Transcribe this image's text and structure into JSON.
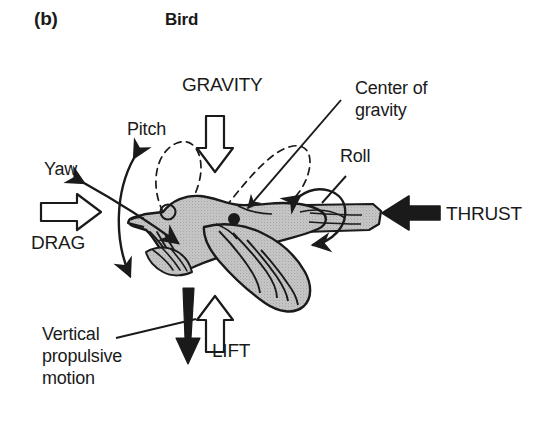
{
  "figure": {
    "panel_letter": "(b)",
    "title": "Bird",
    "background_color": "#ffffff",
    "ink_color": "#1a1a1a",
    "body_fill_color": "#c4c4c4"
  },
  "labels": {
    "gravity": "GRAVITY",
    "thrust": "THRUST",
    "drag": "DRAG",
    "lift": "LIFT",
    "pitch": "Pitch",
    "yaw": "Yaw",
    "roll": "Roll",
    "center_of_gravity_line1": "Center of",
    "center_of_gravity_line2": "gravity",
    "vertical_propulsive_line1": "Vertical",
    "vertical_propulsive_line2": "propulsive",
    "vertical_propulsive_line3": "motion"
  },
  "diagram_elements": {
    "gravity_arrow": "hollow-outline arrow pointing down",
    "thrust_arrow": "solid black arrow pointing left",
    "drag_arrow": "hollow-outline arrow pointing right",
    "lift_arrow": "hollow-outline arrow pointing up",
    "vertical_propulsive_arrow": "solid black tapering arrow pointing down",
    "pitch_arrow": "curved double-headed arrow, vertical axis",
    "yaw_arrow": "straight double-headed arrow, diagonal axis",
    "roll_arrow": "circular double-headed arrow around body axis",
    "center_of_gravity_marker": "filled black dot on bird body",
    "wingbeat_paths": "two dashed teardrop loops above the bird",
    "subject": "bird in flight, left-facing, gray stippled body"
  }
}
